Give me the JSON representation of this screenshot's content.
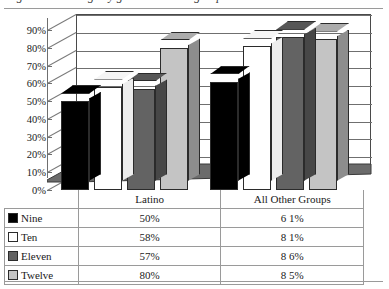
{
  "caption": {
    "text": "Figure: Percentage by grade level and group"
  },
  "chart_data": {
    "type": "bar",
    "title": "",
    "subtitle": "",
    "xlabel": "",
    "ylabel": "",
    "categories": [
      "Latino",
      "All Other Groups"
    ],
    "series": [
      {
        "name": "Nine",
        "values": [
          50,
          61
        ],
        "color": "#000000"
      },
      {
        "name": "Ten",
        "values": [
          58,
          81
        ],
        "color": "#ffffff"
      },
      {
        "name": "Eleven",
        "values": [
          57,
          86
        ],
        "color": "#636363"
      },
      {
        "name": "Twelve",
        "values": [
          80,
          85
        ],
        "color": "#c4c4c4"
      }
    ],
    "ylim": [
      0,
      90
    ],
    "ytick_values": [
      0,
      10,
      20,
      30,
      40,
      50,
      60,
      70,
      80,
      90
    ],
    "ytick_labels": [
      "0%",
      "10%",
      "20%",
      "30%",
      "40%",
      "50%",
      "60%",
      "70%",
      "80%",
      "90%"
    ],
    "grid": true,
    "legend_position": "table-below",
    "three_d": true,
    "annotations": []
  },
  "table": {
    "headers": [
      "",
      "Latino",
      "All Other Groups"
    ],
    "rows": [
      {
        "label": "Nine",
        "swatch": "#000000",
        "latino": "50%",
        "other": "6 1%"
      },
      {
        "label": "Ten",
        "swatch": "#ffffff",
        "latino": "58%",
        "other": "8 1%"
      },
      {
        "label": "Eleven",
        "swatch": "#636363",
        "latino": "57%",
        "other": "8 6%"
      },
      {
        "label": "Twelve",
        "swatch": "#c4c4c4",
        "latino": "80%",
        "other": "8 5%"
      }
    ]
  },
  "colors": {
    "floor": "#6b6b6b",
    "floor_edge": "#3a3a3a",
    "gridline": "#6f6f6f",
    "axis": "#6f6f6f",
    "rule": "#9a9a9a"
  }
}
